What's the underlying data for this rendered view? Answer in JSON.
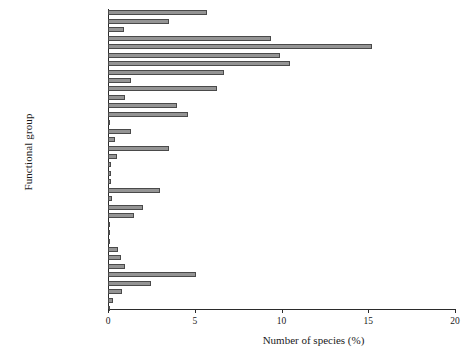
{
  "chart_data": {
    "type": "bar",
    "orientation": "horizontal",
    "title": "",
    "xlabel": "Number of species (%)",
    "ylabel": "Functional group",
    "xlim": [
      0,
      20
    ],
    "xticks": [
      0,
      5,
      10,
      15,
      20
    ],
    "grid": false,
    "legend": null,
    "bar_color": "#949494",
    "bar_edge_color": "#4a4a4a",
    "categories": [
      "Seabirds",
      "Marine mammals",
      "Turtles",
      "Bathydemersal fishes",
      "Bathypelagic fishes",
      "Benthopelagic fishes",
      "Demersal fishes",
      "Pelagic fishes",
      "Reef-associated",
      "Cephalopods",
      "Lobsters",
      "Crabs",
      "Shrimps and prawns",
      "Pycnogonids",
      "Bivalves",
      "Chitons",
      "Gastropods",
      "Echinoderms",
      "Ascidians",
      "Hexacorals",
      "Brachiopods",
      "Polychaetes",
      "Cirripeds",
      "Isopods",
      "Amphipods",
      "Stomatopods",
      "Mysids",
      "Harpacticoids",
      "Hydroids",
      "Jellyfishes",
      "Planktonic",
      "Macroalgae",
      "Diatoms",
      "Dinoflagellates",
      "Protozoans",
      "Bacteria"
    ],
    "values": [
      5.7,
      3.5,
      0.9,
      9.4,
      15.2,
      9.9,
      10.5,
      6.7,
      1.3,
      6.3,
      1.0,
      4.0,
      4.6,
      0.1,
      1.3,
      0.4,
      3.5,
      0.5,
      0.2,
      0.15,
      0.15,
      3.0,
      0.25,
      2.0,
      1.5,
      0.1,
      0.1,
      0.1,
      0.6,
      0.75,
      1.0,
      5.1,
      2.5,
      0.8,
      0.3,
      0.05
    ]
  }
}
